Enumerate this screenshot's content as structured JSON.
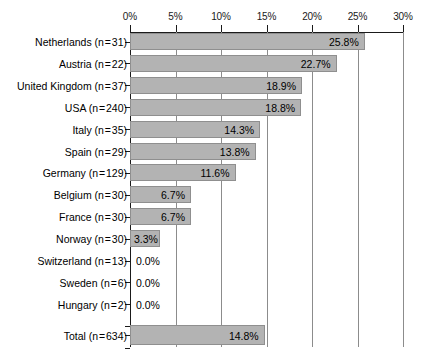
{
  "chart_data": {
    "type": "bar",
    "orientation": "horizontal",
    "title": "",
    "subtitle": "",
    "xlabel": "",
    "ylabel": "",
    "xlim": [
      0,
      30
    ],
    "xtick_labels": [
      "0%",
      "5%",
      "10%",
      "15%",
      "20%",
      "25%",
      "30%"
    ],
    "xticks": [
      0,
      5,
      10,
      15,
      20,
      25,
      30
    ],
    "grid": true,
    "grid_axis": "x",
    "legend": "none",
    "value_label_format": "one-decimal-percent",
    "bar_color": "#b3b3b3",
    "bar_border_color": "#8f8f8f",
    "axis_color": "#1a1a1a",
    "gridline_color": "#8c8c8c",
    "categories": [
      "Netherlands (n = 31)",
      "Austria (n = 22)",
      "United Kingdom (n = 37)",
      "USA (n = 240)",
      "Italy (n = 35)",
      "Spain (n = 29)",
      "Germany (n = 129)",
      "Belgium (n = 30)",
      "France (n = 30)",
      "Norway (n = 30)",
      "Switzerland (n = 13)",
      "Sweden (n = 6)",
      "Hungary (n = 2)"
    ],
    "values": [
      25.8,
      22.7,
      18.9,
      18.8,
      14.3,
      13.8,
      11.6,
      6.7,
      6.7,
      3.3,
      0.0,
      0.0,
      0.0
    ],
    "value_labels": [
      "25.8%",
      "22.7%",
      "18.9%",
      "18.8%",
      "14.3%",
      "13.8%",
      "11.6%",
      "6.7%",
      "6.7%",
      "3.3%",
      "0.0%",
      "0.0%",
      "0.0%"
    ],
    "sample_sizes": [
      31,
      22,
      37,
      240,
      35,
      29,
      129,
      30,
      30,
      30,
      13,
      6,
      2
    ],
    "summary_row": {
      "category": "Total (n = 634)",
      "value": 14.8,
      "value_label": "14.8%",
      "sample_size": 634
    }
  },
  "rows": [
    {
      "label": "Netherlands (n = 31)",
      "value": 25.8,
      "value_label": "25.8%"
    },
    {
      "label": "Austria (n = 22)",
      "value": 22.7,
      "value_label": "22.7%"
    },
    {
      "label": "United Kingdom (n = 37)",
      "value": 18.9,
      "value_label": "18.9%"
    },
    {
      "label": "USA (n = 240)",
      "value": 18.8,
      "value_label": "18.8%"
    },
    {
      "label": "Italy (n = 35)",
      "value": 14.3,
      "value_label": "14.3%"
    },
    {
      "label": "Spain (n = 29)",
      "value": 13.8,
      "value_label": "13.8%"
    },
    {
      "label": "Germany (n = 129)",
      "value": 11.6,
      "value_label": "11.6%"
    },
    {
      "label": "Belgium (n = 30)",
      "value": 6.7,
      "value_label": "6.7%"
    },
    {
      "label": "France (n = 30)",
      "value": 6.7,
      "value_label": "6.7%"
    },
    {
      "label": "Norway (n = 30)",
      "value": 3.3,
      "value_label": "3.3%"
    },
    {
      "label": "Switzerland (n = 13)",
      "value": 0.0,
      "value_label": "0.0%"
    },
    {
      "label": "Sweden (n = 6)",
      "value": 0.0,
      "value_label": "0.0%"
    },
    {
      "label": "Hungary (n = 2)",
      "value": 0.0,
      "value_label": "0.0%"
    }
  ],
  "total_row": {
    "label": "Total (n = 634)",
    "value": 14.8,
    "value_label": "14.8%"
  },
  "axis": {
    "ticks": [
      {
        "label": "0%",
        "value": 0
      },
      {
        "label": "5%",
        "value": 5
      },
      {
        "label": "10%",
        "value": 10
      },
      {
        "label": "15%",
        "value": 15
      },
      {
        "label": "20%",
        "value": 20
      },
      {
        "label": "25%",
        "value": 25
      },
      {
        "label": "30%",
        "value": 30
      }
    ]
  }
}
